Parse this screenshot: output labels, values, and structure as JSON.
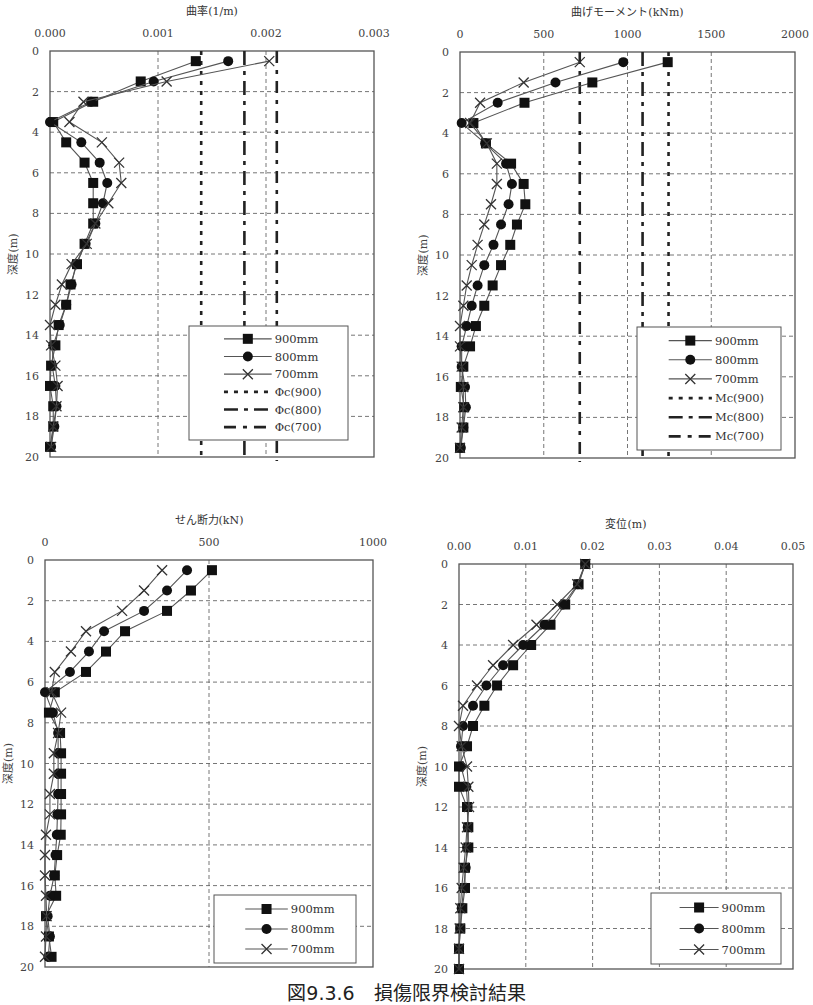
{
  "caption": "図9.3.6　損傷限界検討結果",
  "y_axis_label": "深度(m)",
  "chart_data": [
    {
      "id": "curvature",
      "type": "line",
      "title": "曲率(1/m)",
      "xlabel": "曲率(1/m)",
      "ylabel": "深度(m)",
      "xlim": [
        0,
        0.003
      ],
      "ylim": [
        0,
        20
      ],
      "y_inverted": true,
      "x_axis_position": "top",
      "x_ticks": [
        0,
        0.001,
        0.002,
        0.003
      ],
      "x_tick_labels": [
        "0.000",
        "0.001",
        "0.002",
        "0.003"
      ],
      "y_ticks": [
        0,
        2,
        4,
        6,
        8,
        10,
        12,
        14,
        16,
        18,
        20
      ],
      "grid": true,
      "plot_box": {
        "x0": 50,
        "y0": 51,
        "x1": 374,
        "y1": 457
      },
      "legend_box": {
        "x": 189,
        "y": 326,
        "w": 159,
        "h": 114
      },
      "depths": [
        0.5,
        1.5,
        2.5,
        3.5,
        4.5,
        5.5,
        6.5,
        7.5,
        8.5,
        9.5,
        10.5,
        11.5,
        12.5,
        13.5,
        14.5,
        15.5,
        16.5,
        17.5,
        18.5,
        19.5
      ],
      "series": [
        {
          "name": "900mm",
          "marker": "square",
          "values": [
            0.00135,
            0.00084,
            0.0004,
            3e-05,
            0.00015,
            0.00032,
            0.0004,
            0.0004,
            0.0004,
            0.00032,
            0.00025,
            0.00019,
            0.00015,
            8e-05,
            5e-05,
            1e-05,
            0.0,
            3e-05,
            3e-05,
            0.0
          ]
        },
        {
          "name": "800mm",
          "marker": "circle",
          "values": [
            0.00165,
            0.00096,
            0.00038,
            0.0,
            0.00029,
            0.00046,
            0.00053,
            0.00049,
            0.00042,
            0.00033,
            0.00024,
            0.0002,
            0.00015,
            9e-05,
            3e-05,
            2e-05,
            5e-05,
            6e-05,
            4e-05,
            1e-05
          ]
        },
        {
          "name": "700mm",
          "marker": "x",
          "values": [
            0.00203,
            0.00108,
            0.00031,
            0.00018,
            0.00048,
            0.00064,
            0.00066,
            0.00054,
            0.00042,
            0.00034,
            0.0002,
            0.00011,
            5e-05,
            0.0,
            1e-05,
            5e-05,
            7e-05,
            6e-05,
            3e-05,
            1e-05
          ]
        }
      ],
      "limit_lines": [
        {
          "name": "Φc(900)",
          "value": 0.0014,
          "style": "dotted"
        },
        {
          "name": "Φc(800)",
          "value": 0.0018,
          "style": "dashdot"
        },
        {
          "name": "Φc(700)",
          "value": 0.0021,
          "style": "dashdot2"
        }
      ]
    },
    {
      "id": "moment",
      "type": "line",
      "title": "曲げモーメント(kNm)",
      "xlabel": "曲げモーメント(kNm)",
      "ylabel": "深度(m)",
      "xlim": [
        0,
        2000
      ],
      "ylim": [
        0,
        20
      ],
      "y_inverted": true,
      "x_axis_position": "top",
      "x_ticks": [
        0,
        500,
        1000,
        1500,
        2000
      ],
      "x_tick_labels": [
        "0",
        "500",
        "1000",
        "1500",
        "2000"
      ],
      "y_ticks": [
        0,
        2,
        4,
        6,
        8,
        10,
        12,
        14,
        16,
        18,
        20
      ],
      "grid": true,
      "plot_box": {
        "x0": 460,
        "y0": 52,
        "x1": 795,
        "y1": 458
      },
      "legend_box": {
        "x": 637,
        "y": 327,
        "w": 144,
        "h": 123
      },
      "depths": [
        0.5,
        1.5,
        2.5,
        3.5,
        4.5,
        5.5,
        6.5,
        7.5,
        8.5,
        9.5,
        10.5,
        11.5,
        12.5,
        13.5,
        14.5,
        15.5,
        16.5,
        17.5,
        18.5,
        19.5
      ],
      "series": [
        {
          "name": "900mm",
          "marker": "square",
          "values": [
            1240,
            790,
            385,
            80,
            155,
            305,
            380,
            390,
            340,
            300,
            245,
            195,
            145,
            95,
            60,
            20,
            5,
            25,
            20,
            0
          ]
        },
        {
          "name": "800mm",
          "marker": "circle",
          "values": [
            975,
            570,
            225,
            10,
            150,
            275,
            310,
            290,
            245,
            200,
            145,
            105,
            70,
            40,
            10,
            10,
            30,
            35,
            20,
            5
          ]
        },
        {
          "name": "700mm",
          "marker": "x",
          "values": [
            715,
            380,
            120,
            60,
            160,
            220,
            220,
            185,
            145,
            105,
            70,
            40,
            20,
            0,
            0,
            10,
            20,
            20,
            10,
            0
          ]
        }
      ],
      "limit_lines": [
        {
          "name": "Mc(900)",
          "value": 1245,
          "style": "dotted"
        },
        {
          "name": "Mc(800)",
          "value": 1090,
          "style": "dashdot"
        },
        {
          "name": "Mc(700)",
          "value": 715,
          "style": "dashdot2"
        }
      ]
    },
    {
      "id": "shear",
      "type": "line",
      "title": "せん断力(kN)",
      "xlabel": "せん断力(kN)",
      "ylabel": "深度(m)",
      "xlim": [
        0,
        1000
      ],
      "ylim": [
        0,
        20
      ],
      "y_inverted": true,
      "x_axis_position": "top",
      "x_ticks": [
        0,
        500,
        1000
      ],
      "x_tick_labels": [
        "0",
        "500",
        "1000"
      ],
      "y_ticks": [
        0,
        2,
        4,
        6,
        8,
        10,
        12,
        14,
        16,
        18,
        20
      ],
      "grid": true,
      "plot_box": {
        "x0": 45,
        "y0": 560,
        "x1": 373,
        "y1": 967
      },
      "legend_box": {
        "x": 214,
        "y": 895,
        "w": 142,
        "h": 68
      },
      "depths": [
        0.5,
        1.5,
        2.5,
        3.5,
        4.5,
        5.5,
        6.5,
        7.5,
        8.5,
        9.5,
        10.5,
        11.5,
        12.5,
        13.5,
        14.5,
        15.5,
        16.5,
        17.5,
        18.5,
        19.5
      ],
      "series": [
        {
          "name": "900mm",
          "marker": "square",
          "values": [
            509,
            445,
            372,
            244,
            186,
            125,
            30,
            12,
            46,
            49,
            49,
            49,
            49,
            48,
            37,
            30,
            34,
            3,
            12,
            20
          ]
        },
        {
          "name": "800mm",
          "marker": "circle",
          "values": [
            433,
            372,
            302,
            180,
            134,
            76,
            0,
            24,
            40,
            40,
            40,
            40,
            38,
            36,
            32,
            28,
            15,
            8,
            15,
            10
          ]
        },
        {
          "name": "700mm",
          "marker": "x",
          "values": [
            357,
            302,
            235,
            125,
            79,
            30,
            20,
            49,
            40,
            27,
            27,
            15,
            15,
            3,
            0,
            0,
            3,
            5,
            3,
            0
          ]
        }
      ]
    },
    {
      "id": "displacement",
      "type": "line",
      "title": "変位(m)",
      "xlabel": "変位(m)",
      "ylabel": "深度(m)",
      "xlim": [
        0,
        0.05
      ],
      "ylim": [
        0,
        20
      ],
      "y_inverted": true,
      "x_axis_position": "top",
      "x_ticks": [
        0,
        0.01,
        0.02,
        0.03,
        0.04,
        0.05
      ],
      "x_tick_labels": [
        "0.00",
        "0.01",
        "0.02",
        "0.03",
        "0.04",
        "0.05"
      ],
      "y_ticks": [
        0,
        2,
        4,
        6,
        8,
        10,
        12,
        14,
        16,
        18,
        20
      ],
      "grid": true,
      "plot_box": {
        "x0": 459,
        "y0": 564,
        "x1": 793,
        "y1": 969
      },
      "legend_box": {
        "x": 651,
        "y": 893,
        "w": 130,
        "h": 71
      },
      "depths": [
        0,
        1,
        2,
        3,
        4,
        5,
        6,
        7,
        8,
        9,
        10,
        11,
        12,
        13,
        14,
        15,
        16,
        17,
        18,
        19,
        20
      ],
      "series": [
        {
          "name": "900mm",
          "marker": "square",
          "values": [
            0.0189,
            0.0179,
            0.0159,
            0.0137,
            0.0108,
            0.0081,
            0.0057,
            0.0038,
            0.0021,
            0.0012,
            0.0,
            0.0,
            0.0012,
            0.0014,
            0.0014,
            0.0009,
            0.0009,
            0.0005,
            0.0002,
            0.0,
            0.0
          ]
        },
        {
          "name": "800mm",
          "marker": "circle",
          "values": [
            0.0189,
            0.0178,
            0.0156,
            0.0128,
            0.0096,
            0.0066,
            0.0041,
            0.0021,
            0.0006,
            0.0003,
            0.0003,
            0.0011,
            0.0013,
            0.0013,
            0.0012,
            0.001,
            0.0007,
            0.0004,
            0.0002,
            0.0,
            0.0
          ]
        },
        {
          "name": "700mm",
          "marker": "x",
          "values": [
            0.0189,
            0.0177,
            0.0147,
            0.0116,
            0.0081,
            0.0051,
            0.0027,
            0.0006,
            0.0,
            0.0004,
            0.0012,
            0.0014,
            0.0015,
            0.0012,
            0.001,
            0.0007,
            0.0004,
            0.0002,
            0.0001,
            0.0,
            0.0
          ]
        }
      ]
    }
  ]
}
